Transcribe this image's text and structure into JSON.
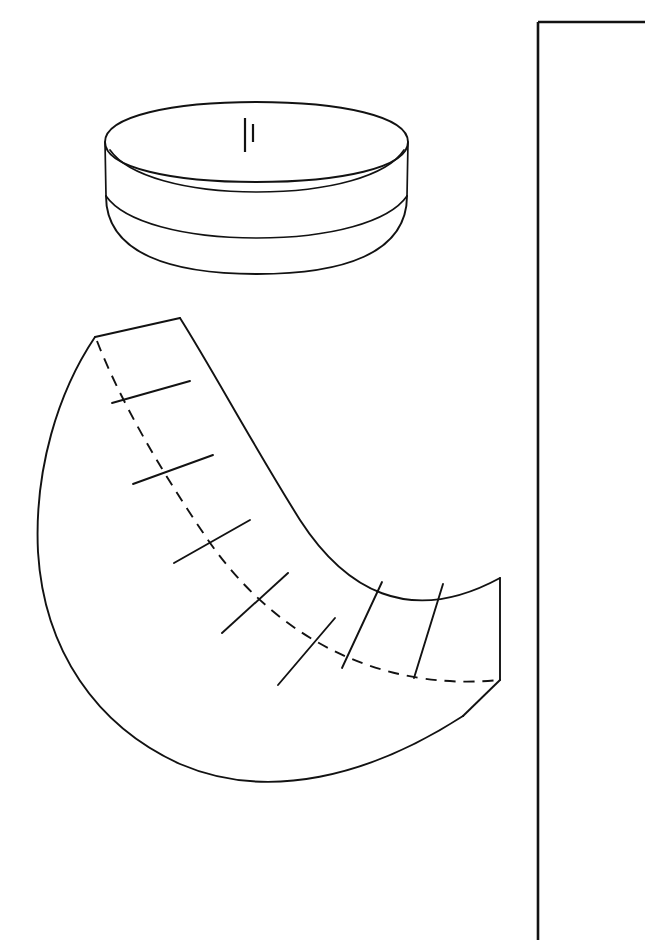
{
  "document": {
    "title": "Bowl and Gore Pattern Diagram",
    "background_color": "#ffffff",
    "ink_color": "#121212",
    "width": 645,
    "height": 940
  },
  "page_border": {
    "label": "Page border rule",
    "corner_x": 538,
    "corner_y": 22,
    "vertical_rule_label": "Vertical page rule",
    "horizontal_rule_label": "Horizontal page rule"
  },
  "figures": [
    {
      "name": "bowl",
      "label": "Bowl in perspective",
      "parts": [
        {
          "name": "rim-ellipse",
          "label": "Outer rim ellipse"
        },
        {
          "name": "collar-band",
          "label": "Cylindrical collar band"
        },
        {
          "name": "inner-ellipse",
          "label": "Inner mouth ellipse"
        },
        {
          "name": "collar-bottom",
          "label": "Collar lower ellipse"
        },
        {
          "name": "bowl-body",
          "label": "Hemispherical bowl body"
        },
        {
          "name": "seam-line",
          "label": "Vertical seam line"
        },
        {
          "name": "tick-mark",
          "label": "Registration tick mark"
        }
      ]
    },
    {
      "name": "gore-pattern",
      "label": "Flat gore layout crescent",
      "segment_count": 8,
      "divider_count": 7,
      "parts": [
        {
          "name": "outer-arc",
          "label": "Outer solid arc"
        },
        {
          "name": "inner-arc",
          "label": "Inner dashed arc"
        },
        {
          "name": "top-edge",
          "label": "Top straight edge"
        },
        {
          "name": "end-edge",
          "label": "Right end edge"
        },
        {
          "name": "dividers",
          "label": "Radial segment dividers"
        }
      ]
    }
  ],
  "geometry": {
    "bowl": {
      "rim_outer": "M 105 142 C 105 116, 173 102, 256 102 C 340 102, 408 116, 408 142 C 408 168, 340 182, 256 182 C 173 182, 105 168, 105 142 Z",
      "rim_inner": "M 110 150 C 128 176, 186 192, 257 192 C 329 192, 387 176, 404 150",
      "collar_left": "M 105 142 L 106 196",
      "collar_right": "M 408 142 L 407 196",
      "collar_bottom": "M 106 196 C 124 222, 184 238, 257 238 C 330 238, 389 222, 407 196",
      "body": "M 106 196 C 106 254, 172 274, 257 274 C 342 274, 407 254, 407 196",
      "seam": "M 245 118 L 245 152",
      "tick": "M 253 124 L 253 142"
    },
    "gore": {
      "top_edge": "M 95 337 L 180 318",
      "outer_arc": "M 180 318 C 214 372, 250 440, 300 520 C 344 588, 408 628, 500 578",
      "outer_lower": "M 500 578 L 500 680",
      "tip_bevel": "M 500 680 L 463 716",
      "outer_big": "M 95 337 C 58 392, 34 470, 38 552 C 44 650, 96 726, 180 764 C 268 802, 370 776, 463 716",
      "inner_arc": "M 97 341 C 120 400, 160 470, 208 540 C 258 612, 330 664, 420 678 C 452 683, 478 682, 500 680",
      "dividers": [
        "M 112 403 L 190 381",
        "M 133 484 L 213 455",
        "M 174 563 L 250 520",
        "M 222 633 L 288 573",
        "M 278 685 L 335 618",
        "M 342 668 L 382 582",
        "M 414 678 L 443 584"
      ]
    }
  }
}
